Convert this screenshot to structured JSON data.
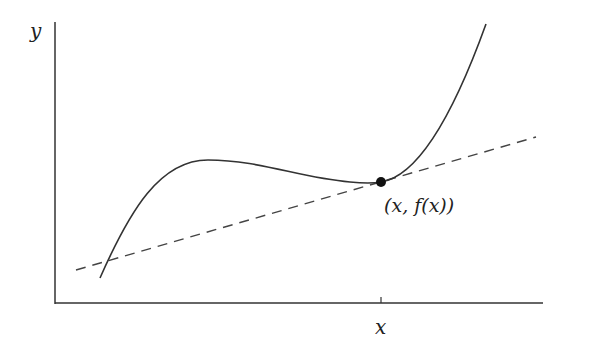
{
  "diagram": {
    "y_axis_label": "y",
    "x_axis_label": "x",
    "point_label": "(x, f(x))",
    "curve_color": "#333333",
    "tangent_color": "#444444",
    "axis_color": "#333333",
    "elements": [
      "cubic-curve f(x)",
      "dashed tangent line at point",
      "point (x, f(x))",
      "x-axis tick at x"
    ]
  }
}
